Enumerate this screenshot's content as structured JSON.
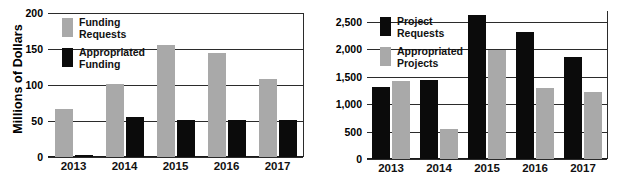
{
  "chart_data": [
    {
      "type": "bar",
      "title": "",
      "panel_name": "funding-chart",
      "xlabel": "",
      "ylabel": "Millions of Dollars",
      "categories": [
        "2013",
        "2014",
        "2015",
        "2016",
        "2017"
      ],
      "ylim": [
        0,
        200
      ],
      "yticks": [
        0,
        50,
        100,
        150,
        200
      ],
      "ytick_labels": [
        "0",
        "50",
        "100",
        "150",
        "200"
      ],
      "grid": true,
      "legend_position": "upper-left inside",
      "series": [
        {
          "name": "Funding Requests",
          "color": "#a9a9a9",
          "values": [
            66,
            101,
            155,
            145,
            108
          ]
        },
        {
          "name": "Appropriated Funding",
          "color": "#0b0b0b",
          "values": [
            3,
            55,
            52,
            52,
            52
          ]
        }
      ]
    },
    {
      "type": "bar",
      "title": "",
      "panel_name": "projects-chart",
      "xlabel": "",
      "ylabel": "",
      "categories": [
        "2013",
        "2014",
        "2015",
        "2016",
        "2017"
      ],
      "ylim": [
        0,
        2700
      ],
      "yticks": [
        0,
        500,
        1000,
        1500,
        2000,
        2500
      ],
      "ytick_labels": [
        "0",
        "500",
        "1,000",
        "1,500",
        "2,000",
        "2,500"
      ],
      "grid": true,
      "legend_position": "upper-left inside",
      "series": [
        {
          "name": "Project Requests",
          "color": "#0b0b0b",
          "values": [
            1310,
            1440,
            2620,
            2310,
            1870
          ]
        },
        {
          "name": "Appropriated Projects",
          "color": "#a9a9a9",
          "values": [
            1430,
            545,
            1980,
            1290,
            1215
          ]
        }
      ]
    }
  ],
  "left_chart": {
    "ylabel": "Millions of Dollars",
    "ytick_labels": [
      "200",
      "150",
      "100",
      "50",
      "0"
    ],
    "xtick_labels": [
      "2013",
      "2014",
      "2015",
      "2016",
      "2017"
    ],
    "legend": [
      {
        "label": "Funding\nRequests",
        "color": "#a9a9a9"
      },
      {
        "label": "Appropriated\nFunding",
        "color": "#0b0b0b"
      }
    ]
  },
  "right_chart": {
    "ylabel": "",
    "ytick_labels": [
      "2,500",
      "2,000",
      "1,500",
      "1,000",
      "500",
      "0"
    ],
    "xtick_labels": [
      "2013",
      "2014",
      "2015",
      "2016",
      "2017"
    ],
    "legend": [
      {
        "label": "Project\nRequests",
        "color": "#0b0b0b"
      },
      {
        "label": "Appropriated\nProjects",
        "color": "#a9a9a9"
      }
    ]
  },
  "colors": {
    "gray_series": "#a9a9a9",
    "black_series": "#0b0b0b",
    "gridline": "#2b2b2b",
    "background": "#ffffff"
  }
}
